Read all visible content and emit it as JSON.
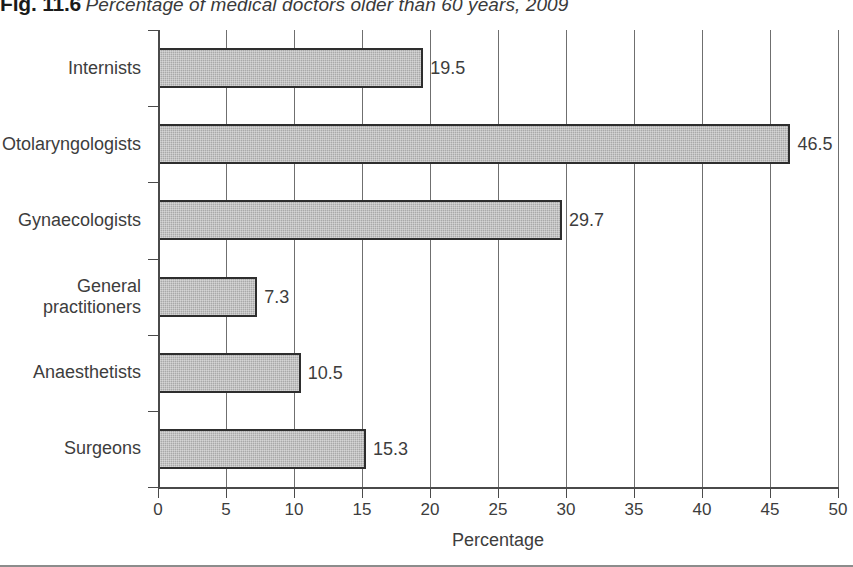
{
  "caption": {
    "number": "Fig. 11.6",
    "title": "Percentage of medical doctors older than 60 years, 2009"
  },
  "chart_data": {
    "type": "bar",
    "orientation": "horizontal",
    "title": "Percentage of medical doctors older than 60 years, 2009",
    "categories": [
      "Internists",
      "Otolaryngologists",
      "Gynaecologists",
      "General\npractitioners",
      "Anaesthetists",
      "Surgeons"
    ],
    "values": [
      19.5,
      46.5,
      29.7,
      7.3,
      10.5,
      15.3
    ],
    "value_labels": [
      "19.5",
      "46.5",
      "29.7",
      "7.3",
      "10.5",
      "15.3"
    ],
    "xlabel": "Percentage",
    "ylabel": "",
    "xlim": [
      0,
      50
    ],
    "xticks": [
      0,
      5,
      10,
      15,
      20,
      25,
      30,
      35,
      40,
      45,
      50
    ],
    "xtick_labels": [
      "0",
      "5",
      "10",
      "15",
      "20",
      "25",
      "30",
      "35",
      "40",
      "45",
      "50"
    ],
    "grid": "vertical",
    "legend": null,
    "bar_color": "#a9a9a9",
    "bar_edge_color": "#2e2e2e",
    "axis_color": "#4a4a4a"
  }
}
